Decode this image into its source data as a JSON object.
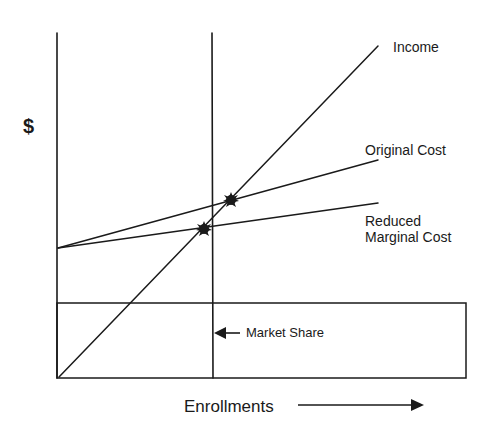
{
  "diagram": {
    "y_axis_label": "$",
    "x_axis_label": "Enrollments",
    "lines": {
      "income": {
        "label": "Income"
      },
      "original_cost": {
        "label": "Original Cost"
      },
      "reduced_marginal_cost": {
        "label_line1": "Reduced",
        "label_line2": "Marginal Cost"
      }
    },
    "market_share": {
      "label": "Market Share"
    },
    "colors": {
      "ink": "#1a1a1a",
      "background": "#ffffff"
    }
  }
}
